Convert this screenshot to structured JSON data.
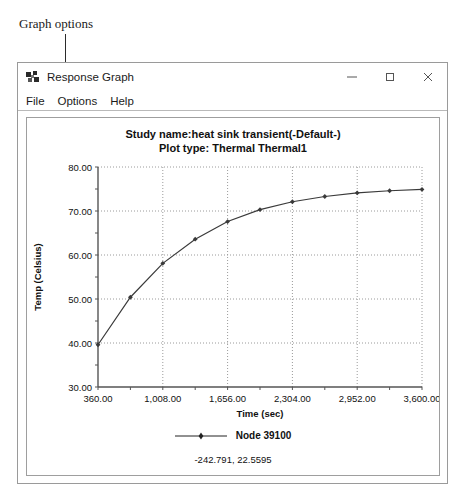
{
  "annotation": {
    "text": "Graph options"
  },
  "window": {
    "title": "Response Graph",
    "icon": "app-graph-icon",
    "controls": [
      {
        "name": "minimize",
        "glyph": "minimize-icon"
      },
      {
        "name": "maximize",
        "glyph": "maximize-icon"
      },
      {
        "name": "close",
        "glyph": "close-icon"
      }
    ]
  },
  "menu": {
    "items": [
      {
        "label": "File"
      },
      {
        "label": "Options"
      },
      {
        "label": "Help"
      }
    ]
  },
  "chart_panel": {
    "title_line1": "Study name:heat sink transient(-Default-)",
    "title_line2": "Plot type: Thermal Thermal1",
    "legend_label": "Node 39100",
    "coord_readout": "-242.791, 22.5595"
  },
  "chart_data": {
    "type": "line",
    "title": "Study name:heat sink transient(-Default-)  Plot type: Thermal Thermal1",
    "xlabel": "Time (sec)",
    "ylabel": "Temp (Celsius)",
    "xlim": [
      360,
      3600
    ],
    "ylim": [
      30,
      80
    ],
    "xticks": [
      360,
      1008,
      1656,
      2304,
      2952,
      3600
    ],
    "xticklabels": [
      "360.00",
      "1,008.00",
      "1,656.00",
      "2,304.00",
      "2,952.00",
      "3,600.00"
    ],
    "yticks": [
      30,
      40,
      50,
      60,
      70,
      80
    ],
    "yticklabels": [
      "30.00",
      "40.00",
      "50.00",
      "60.00",
      "70.00",
      "80.00"
    ],
    "xminor_step": 324,
    "yminor_step": 5,
    "grid": true,
    "grid_style": "dotted",
    "legend_position": "below",
    "line_color": "#3a3a3a",
    "marker": "point",
    "series": [
      {
        "name": "Node 39100",
        "x": [
          360,
          684,
          1008,
          1332,
          1656,
          1980,
          2304,
          2628,
          2952,
          3276,
          3600
        ],
        "y": [
          39.6,
          50.4,
          58.1,
          63.6,
          67.6,
          70.3,
          72.1,
          73.3,
          74.1,
          74.6,
          74.9
        ]
      }
    ]
  }
}
